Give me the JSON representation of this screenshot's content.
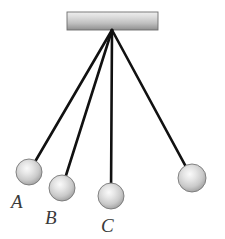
{
  "figure": {
    "kind": "pendulum-diagram",
    "background_color": "#ffffff",
    "support": {
      "label": "ceiling-support-bar",
      "x": 67,
      "y": 12,
      "width": 91,
      "height": 18,
      "fill_top_color": "#e8e8e8",
      "fill_bottom_color": "#9a9a9a",
      "edge_color": "#6e6e6e"
    },
    "pivot": {
      "x": 112,
      "y": 30
    },
    "string_color": "#111111",
    "string_width": 2.6,
    "ball": {
      "radius": 13,
      "highlight_color": "#f2f2f2",
      "mid_color": "#c9c9c9",
      "edge_color": "#8d8d8d",
      "outline_color": "#777777"
    },
    "label_color": "#3a3a3a"
  },
  "pendulums": [
    {
      "id": "A",
      "label": "A",
      "ball_cx": 29,
      "ball_cy": 172,
      "radius": 13,
      "label_x": 11,
      "label_y": 192
    },
    {
      "id": "B",
      "label": "B",
      "ball_cx": 62,
      "ball_cy": 188,
      "radius": 13,
      "label_x": 45,
      "label_y": 208
    },
    {
      "id": "C",
      "label": "C",
      "ball_cx": 111,
      "ball_cy": 196,
      "radius": 13,
      "label_x": 101,
      "label_y": 216
    },
    {
      "id": "D",
      "label": "",
      "ball_cx": 192,
      "ball_cy": 178,
      "radius": 14,
      "label_x": 0,
      "label_y": 0
    }
  ],
  "chart_data": {
    "type": "scatter",
    "title": "",
    "xlabel": "",
    "ylabel": "",
    "categories": [
      "A",
      "B",
      "C",
      "D"
    ],
    "series": [
      {
        "name": "bob-center-x",
        "values": [
          29,
          62,
          111,
          192
        ]
      },
      {
        "name": "bob-center-y",
        "values": [
          172,
          188,
          196,
          178
        ]
      },
      {
        "name": "string-length-px",
        "values": [
          164,
          164,
          166,
          160
        ]
      },
      {
        "name": "bob-radius-px",
        "values": [
          13,
          13,
          13,
          14
        ]
      }
    ],
    "annotations": [
      "A",
      "B",
      "C"
    ],
    "grid": false,
    "legend": "none"
  }
}
